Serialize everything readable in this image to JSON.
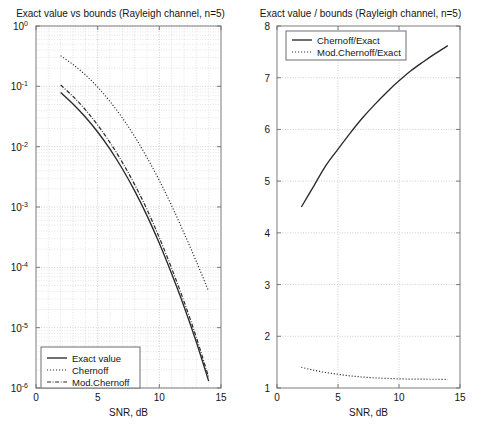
{
  "chart_data": [
    {
      "id": "left",
      "type": "line",
      "title": "Exact value vs bounds (Rayleigh channel, n=5)",
      "xlabel": "SNR, dB",
      "ylabel": "",
      "yscale": "log",
      "xlim": [
        0,
        15
      ],
      "ylim": [
        1e-06,
        1
      ],
      "xticks": [
        "0",
        "5",
        "10",
        "15"
      ],
      "xtickvals": [
        0,
        5,
        10,
        15
      ],
      "ytickvals": [
        1,
        0.1,
        0.01,
        0.001,
        0.0001,
        1e-05,
        1e-06
      ],
      "yticks": [
        "10^0",
        "10^-1",
        "10^-2",
        "10^-3",
        "10^-4",
        "10^-5",
        "10^-6"
      ],
      "ytick_base": "10",
      "ytick_exponents": [
        "0",
        "-1",
        "-2",
        "-3",
        "-4",
        "-5",
        "-6"
      ],
      "grid": true,
      "legend_position": "lower left",
      "legend": [
        "Exact value",
        "Chernoff",
        "Mod.Chernoff"
      ],
      "x": [
        2,
        3,
        4,
        5,
        6,
        7,
        8,
        9,
        10,
        11,
        12,
        13,
        14
      ],
      "series": [
        {
          "name": "Exact value",
          "style": "solid",
          "values": [
            0.079,
            0.051,
            0.031,
            0.0175,
            0.0091,
            0.0043,
            0.00185,
            0.00072,
            0.00025,
            7.8e-05,
            2.25e-05,
            5.8e-06,
            1.3e-06
          ]
        },
        {
          "name": "Chernoff",
          "style": "dotted",
          "values": [
            0.32,
            0.23,
            0.155,
            0.097,
            0.056,
            0.03,
            0.0147,
            0.0066,
            0.00275,
            0.00105,
            0.00037,
            0.000125,
            4e-05
          ]
        },
        {
          "name": "Mod.Chernoff",
          "style": "dashdot",
          "values": [
            0.105,
            0.068,
            0.041,
            0.0228,
            0.0117,
            0.0055,
            0.00235,
            0.00091,
            0.00031,
            9.6e-05,
            2.72e-05,
            6.9e-06,
            1.5e-06
          ]
        }
      ]
    },
    {
      "id": "right",
      "type": "line",
      "title": "Exact value / bounds (Rayleigh channel, n=5)",
      "xlabel": "SNR, dB",
      "ylabel": "",
      "yscale": "linear",
      "xlim": [
        0,
        15
      ],
      "ylim": [
        1,
        8
      ],
      "xticks": [
        "0",
        "5",
        "10",
        "15"
      ],
      "xtickvals": [
        0,
        5,
        10,
        15
      ],
      "yticks": [
        "1",
        "2",
        "3",
        "4",
        "5",
        "6",
        "7",
        "8"
      ],
      "ytickvals": [
        1,
        2,
        3,
        4,
        5,
        6,
        7,
        8
      ],
      "grid": true,
      "legend_position": "upper left",
      "legend": [
        "Chernoff/Exact",
        "Mod.Chernoff/Exact"
      ],
      "x": [
        2,
        3,
        4,
        5,
        6,
        7,
        8,
        9,
        10,
        11,
        12,
        13,
        14
      ],
      "series": [
        {
          "name": "Chernoff/Exact",
          "style": "solid",
          "values": [
            4.5,
            4.9,
            5.3,
            5.62,
            5.93,
            6.22,
            6.48,
            6.72,
            6.94,
            7.14,
            7.31,
            7.47,
            7.62
          ]
        },
        {
          "name": "Mod.Chernoff/Exact",
          "style": "dotted",
          "values": [
            1.4,
            1.345,
            1.3,
            1.265,
            1.235,
            1.212,
            1.196,
            1.185,
            1.177,
            1.172,
            1.17,
            1.169,
            1.168
          ]
        }
      ]
    }
  ],
  "colors": {
    "background": "#ffffff",
    "curve": "#2a2a2a",
    "axis": "#7d7d7d",
    "grid_major": "#b9b9b9",
    "grid_minor": "#d2d2d2",
    "text": "#151515"
  }
}
